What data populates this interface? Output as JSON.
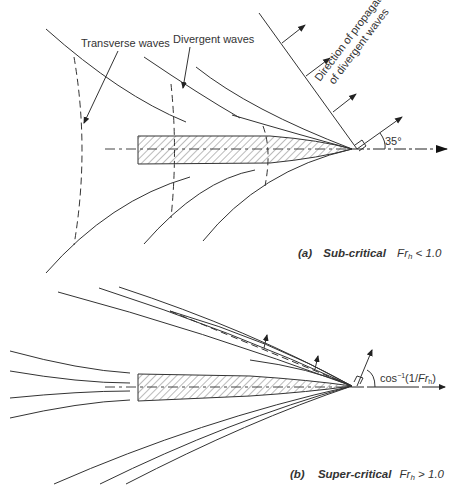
{
  "figure": {
    "panel_a": {
      "labels": {
        "transverse_waves": "Transverse waves",
        "divergent_waves": "Divergent waves",
        "direction_line1": "Direction of propagation",
        "direction_line2": "of divergent waves",
        "angle": "35°"
      },
      "caption": {
        "letter": "(a)",
        "regime": "Sub-critical",
        "symbol": "Fr",
        "subscript": "h",
        "condition": " < 1.0"
      }
    },
    "panel_b": {
      "labels": {
        "angle_prefix": "cos",
        "angle_sup": "−1",
        "angle_open": "(1/",
        "angle_symbol": "Fr",
        "angle_sub": "h",
        "angle_close": ")"
      },
      "caption": {
        "letter": "(b)",
        "regime": "Super-critical",
        "symbol": "Fr",
        "subscript": "h",
        "condition": " > 1.0"
      }
    },
    "colors": {
      "line": "#333333",
      "background": "#ffffff"
    }
  }
}
